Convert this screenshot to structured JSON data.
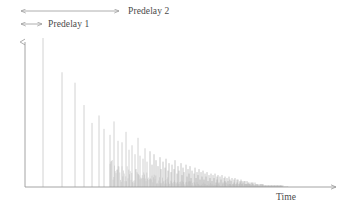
{
  "figure": {
    "name": "reverberation-impulse-response",
    "background_color": "#ffffff"
  },
  "axes": {
    "x_axis": {
      "label": "Time",
      "name": "time-axis",
      "arrow": true,
      "color": "#9a9a9a",
      "x_start": 25,
      "x_end": 340,
      "y": 187
    },
    "y_axis": {
      "label": "",
      "name": "amplitude-axis",
      "arrow": true,
      "color": "#9a9a9a",
      "x": 25,
      "y_start": 187,
      "y_end": 38
    }
  },
  "annotations": [
    {
      "id": "predelay2",
      "label": "Predelay 2",
      "name": "predelay-2-annotation",
      "arrow_style": "double-headed",
      "x_start": 20,
      "x_end": 120,
      "y": 11,
      "label_x": 128,
      "label_y": 6,
      "color": "#9a9a9a"
    },
    {
      "id": "predelay1",
      "label": "Predelay 1",
      "name": "predelay-1-annotation",
      "arrow_style": "double-headed",
      "x_start": 20,
      "x_end": 43,
      "y": 24,
      "label_x": 48,
      "label_y": 19,
      "color": "#9a9a9a"
    }
  ],
  "chart_data": {
    "type": "bar",
    "title": "",
    "subtitle": "",
    "xlabel": "Time",
    "ylabel": "",
    "grid": false,
    "legend": null,
    "xlim": [
      25,
      340
    ],
    "ylim": [
      0,
      1
    ],
    "baseline_y": 187,
    "top_y": 38,
    "spike_color": "#b9b9b9",
    "spike_color_dense": "#a8a8a8",
    "x": [
      43,
      62,
      75,
      84,
      92,
      99,
      104,
      110,
      114,
      118,
      122,
      126,
      129,
      132,
      135,
      138,
      140,
      143,
      145,
      147,
      150,
      152,
      154,
      156,
      158,
      160,
      161,
      163,
      165,
      166,
      168,
      169,
      171,
      172,
      174,
      175,
      177,
      178,
      179,
      181,
      182,
      183,
      184,
      186,
      187,
      188,
      189,
      190,
      191,
      192,
      194,
      195,
      196,
      197,
      198,
      199,
      200,
      201,
      202,
      203,
      204,
      205,
      206,
      207,
      208,
      209,
      210,
      211,
      212,
      213,
      214,
      215,
      216,
      217,
      217,
      218,
      219,
      220,
      221,
      222,
      223,
      224,
      225,
      225,
      226,
      227,
      228,
      229,
      230,
      230,
      231,
      232,
      233,
      234,
      234,
      235,
      236,
      237,
      237,
      238,
      239,
      240,
      240,
      241,
      242,
      242,
      243,
      244,
      245,
      245,
      246,
      247,
      247,
      248,
      249,
      249,
      250,
      251,
      251,
      252,
      253,
      253,
      254,
      255,
      255,
      256,
      257,
      257,
      258,
      258,
      259,
      260,
      260,
      261,
      262,
      262,
      263,
      263,
      264,
      265,
      265,
      266,
      266,
      267,
      268,
      268,
      269,
      269,
      270,
      271,
      271,
      272,
      272,
      273,
      274,
      274,
      275,
      275,
      276,
      277,
      277,
      278,
      278,
      279,
      280,
      280,
      281,
      281,
      282,
      283
    ],
    "values": [
      1.0,
      0.77,
      0.7,
      0.55,
      0.43,
      0.48,
      0.39,
      0.35,
      0.44,
      0.31,
      0.3,
      0.37,
      0.25,
      0.28,
      0.22,
      0.33,
      0.21,
      0.19,
      0.26,
      0.17,
      0.24,
      0.15,
      0.22,
      0.18,
      0.14,
      0.2,
      0.12,
      0.17,
      0.13,
      0.19,
      0.11,
      0.16,
      0.1,
      0.15,
      0.12,
      0.18,
      0.09,
      0.14,
      0.11,
      0.16,
      0.08,
      0.13,
      0.1,
      0.15,
      0.07,
      0.12,
      0.09,
      0.14,
      0.06,
      0.11,
      0.09,
      0.13,
      0.06,
      0.1,
      0.08,
      0.12,
      0.05,
      0.1,
      0.07,
      0.11,
      0.05,
      0.09,
      0.07,
      0.1,
      0.04,
      0.08,
      0.06,
      0.09,
      0.04,
      0.08,
      0.06,
      0.09,
      0.03,
      0.07,
      0.05,
      0.08,
      0.03,
      0.07,
      0.05,
      0.08,
      0.03,
      0.06,
      0.04,
      0.07,
      0.03,
      0.06,
      0.04,
      0.07,
      0.02,
      0.05,
      0.04,
      0.06,
      0.02,
      0.05,
      0.03,
      0.06,
      0.02,
      0.05,
      0.03,
      0.05,
      0.02,
      0.04,
      0.03,
      0.05,
      0.02,
      0.04,
      0.03,
      0.04,
      0.02,
      0.04,
      0.02,
      0.04,
      0.02,
      0.03,
      0.02,
      0.03,
      0.02,
      0.03,
      0.01,
      0.03,
      0.02,
      0.03,
      0.01,
      0.03,
      0.01,
      0.02,
      0.01,
      0.02,
      0.01,
      0.02,
      0.01,
      0.02,
      0.01,
      0.02,
      0.01,
      0.02,
      0.01,
      0.02,
      0.01,
      0.01,
      0.01,
      0.01,
      0.01,
      0.01,
      0.01,
      0.01,
      0.01,
      0.01,
      0.01,
      0.01,
      0.01,
      0.01,
      0.01,
      0.01,
      0.01,
      0.01,
      0.01,
      0.01,
      0.01,
      0.01,
      0.01,
      0.01,
      0.01,
      0.01,
      0.01,
      0.01,
      0.01,
      0.01,
      0.01,
      0.01
    ]
  }
}
